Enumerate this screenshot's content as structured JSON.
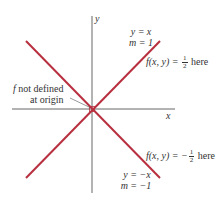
{
  "figure": {
    "axes": {
      "x_label": "x",
      "y_label": "y",
      "color": "#555555"
    },
    "lines": [
      {
        "name": "y = x",
        "equation": "y = x",
        "slope_label": "m = 1",
        "color": "#b8303f"
      },
      {
        "name": "y = -x",
        "equation": "y = −x",
        "slope_label": "m = −1",
        "color": "#b8303f"
      }
    ],
    "annotations": {
      "upper_value": {
        "prefix": "f(x, y) = ",
        "num": "1",
        "den": "2",
        "suffix": " here",
        "sign": ""
      },
      "lower_value": {
        "prefix": "f(x, y) = −",
        "num": "1",
        "den": "2",
        "suffix": " here",
        "sign": "−"
      },
      "origin_note_line1": "f not defined",
      "origin_note_line2": "at origin",
      "origin_note_f": "f",
      "origin_note_rest": " not defined"
    },
    "line1_eq": "y = x",
    "line1_m": "m = 1",
    "line2_eq": "y = −x",
    "line2_m": "m = −1"
  }
}
